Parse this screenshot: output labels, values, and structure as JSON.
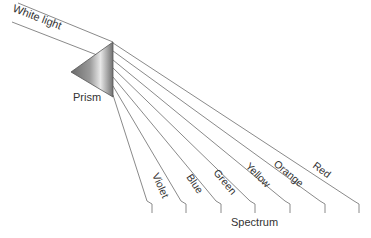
{
  "diagram": {
    "labels": {
      "incoming": "White light",
      "prism": "Prism",
      "spectrum": "Spectrum"
    },
    "colors_order": [
      "Violet",
      "Blue",
      "Green",
      "Yellow",
      "Orange",
      "Red"
    ],
    "bands": [
      {
        "name": "Violet"
      },
      {
        "name": "Blue"
      },
      {
        "name": "Green"
      },
      {
        "name": "Yellow"
      },
      {
        "name": "Orange"
      },
      {
        "name": "Red"
      }
    ],
    "line_color": "#8a8a8a",
    "prism_gradient": [
      "#6e6e6e",
      "#e6e6e6",
      "#7a7a7a"
    ]
  }
}
